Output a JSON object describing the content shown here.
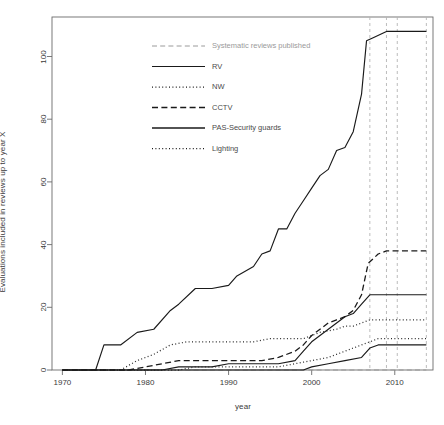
{
  "chart_data": {
    "type": "line",
    "title": "",
    "xlabel": "year",
    "ylabel": "Evaluations included in reviews up to year X",
    "xlim": [
      1968,
      1214
    ],
    "ylim": [
      0,
      112
    ],
    "grid": false,
    "legend_position": "top-left-inside",
    "x_ticks": [
      "1970",
      "1980",
      "1990",
      "2000",
      "2010"
    ],
    "x_tick_values": [
      1970,
      1980,
      1990,
      2000,
      2010
    ],
    "y_ticks": [
      "0",
      "20",
      "40",
      "60",
      "80",
      "100"
    ],
    "y_tick_values": [
      0,
      20,
      40,
      60,
      80,
      100
    ],
    "annotations": {
      "vertical_dashed_lines": [
        2007,
        2009,
        2010.3,
        2013.8
      ]
    },
    "series": [
      {
        "name": "Systematic reviews published",
        "style": "dashed-light",
        "color": "#9a9a9a",
        "x": [
          1970,
          2013.8
        ],
        "values": [
          0,
          0
        ]
      },
      {
        "name": "RV",
        "style": "solid",
        "color": "#1a1a1a",
        "x": [
          1970,
          1974,
          1975,
          1977,
          1979,
          1981,
          1983,
          1984,
          1986,
          1988,
          1990,
          1991,
          1993,
          1994,
          1995,
          1996,
          1997,
          1998,
          1999,
          2000,
          2001,
          2002,
          2003,
          2004,
          2005,
          2006,
          2006.6,
          2007.4,
          2009,
          2013.8
        ],
        "values": [
          0,
          0,
          8,
          8,
          12,
          13,
          19,
          21,
          26,
          26,
          27,
          30,
          33,
          37,
          38,
          45,
          45,
          50,
          54,
          58,
          62,
          64,
          70,
          71,
          76,
          88,
          105,
          106,
          108,
          108
        ]
      },
      {
        "name": "NW",
        "style": "dotted",
        "color": "#2a2a2a",
        "x": [
          1970,
          1977,
          1979,
          1981,
          1983,
          1985,
          1987,
          1989,
          1991,
          1993,
          1995,
          1997,
          1999,
          2000,
          2001,
          2003,
          2004,
          2005,
          2006,
          2007,
          2013.8
        ],
        "values": [
          0,
          0,
          3,
          5,
          8,
          9,
          9,
          9,
          9,
          9,
          10,
          10,
          10,
          11,
          12,
          13,
          14,
          14,
          15,
          16,
          16
        ]
      },
      {
        "name": "CCTV",
        "style": "dashed",
        "color": "#1a1a1a",
        "x": [
          1970,
          1978,
          1980,
          1982,
          1984,
          1986,
          1988,
          1990,
          1992,
          1994,
          1996,
          1998,
          1999,
          2000,
          2001,
          2002,
          2003,
          2004,
          2005,
          2006,
          2006.8,
          2008,
          2009,
          2013.8
        ],
        "values": [
          0,
          0,
          1,
          2,
          3,
          3,
          3,
          3,
          3,
          3,
          4,
          6,
          8,
          11,
          13,
          15,
          16,
          17,
          19,
          24,
          34,
          37,
          38,
          38
        ]
      },
      {
        "name": "PAS-Security guards",
        "style": "solid",
        "color": "#1a1a1a",
        "x": [
          1970,
          1982,
          1984,
          1986,
          1988,
          1990,
          1992,
          1994,
          1996,
          1998,
          1999,
          2000,
          2001,
          2002,
          2003,
          2004,
          2005,
          2006,
          2007,
          2008,
          2009,
          2013.8
        ],
        "values": [
          0,
          0,
          1,
          1,
          1,
          2,
          2,
          2,
          2,
          3,
          6,
          9,
          11,
          13,
          15,
          17,
          18,
          21,
          24,
          24,
          24,
          24
        ]
      },
      {
        "name": "Lighting",
        "style": "dotted",
        "color": "#2a2a2a",
        "x": [
          1970,
          1984,
          1986,
          1988,
          1990,
          1992,
          1994,
          1996,
          1998,
          2000,
          2002,
          2003,
          2004,
          2005,
          2006,
          2007,
          2008,
          2013.8
        ],
        "values": [
          0,
          0,
          1,
          1,
          1,
          1,
          1,
          1,
          2,
          3,
          4,
          5,
          6,
          7,
          8,
          9,
          10,
          10
        ]
      },
      {
        "name": "baseline-flat",
        "style": "solid",
        "color": "#1a1a1a",
        "x": [
          1970,
          1999,
          2000,
          2002,
          2004,
          2006,
          2007,
          2008,
          2013.8
        ],
        "values": [
          0,
          0,
          1,
          2,
          3,
          4,
          7,
          8,
          8
        ]
      }
    ],
    "legend_entries": [
      {
        "label": "Systematic reviews published",
        "style": "dashed-light"
      },
      {
        "label": "RV",
        "style": "solid"
      },
      {
        "label": "NW",
        "style": "dotted"
      },
      {
        "label": "CCTV",
        "style": "dashed"
      },
      {
        "label": "PAS-Security guards",
        "style": "solid-thick"
      },
      {
        "label": "Lighting",
        "style": "dotted"
      }
    ]
  }
}
